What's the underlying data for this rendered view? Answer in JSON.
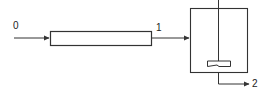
{
  "diagram": {
    "type": "process flow: tubular reactor in series with stirred tank",
    "stream_labels": {
      "inlet": "0",
      "intermediate": "1",
      "outlet": "2"
    },
    "components": [
      {
        "name": "tubular-reactor",
        "shape": "rectangle"
      },
      {
        "name": "stirred-tank-reactor",
        "shape": "open-top vessel with agitator"
      }
    ],
    "colors": {
      "line": "#333333",
      "background": "#ffffff"
    }
  }
}
